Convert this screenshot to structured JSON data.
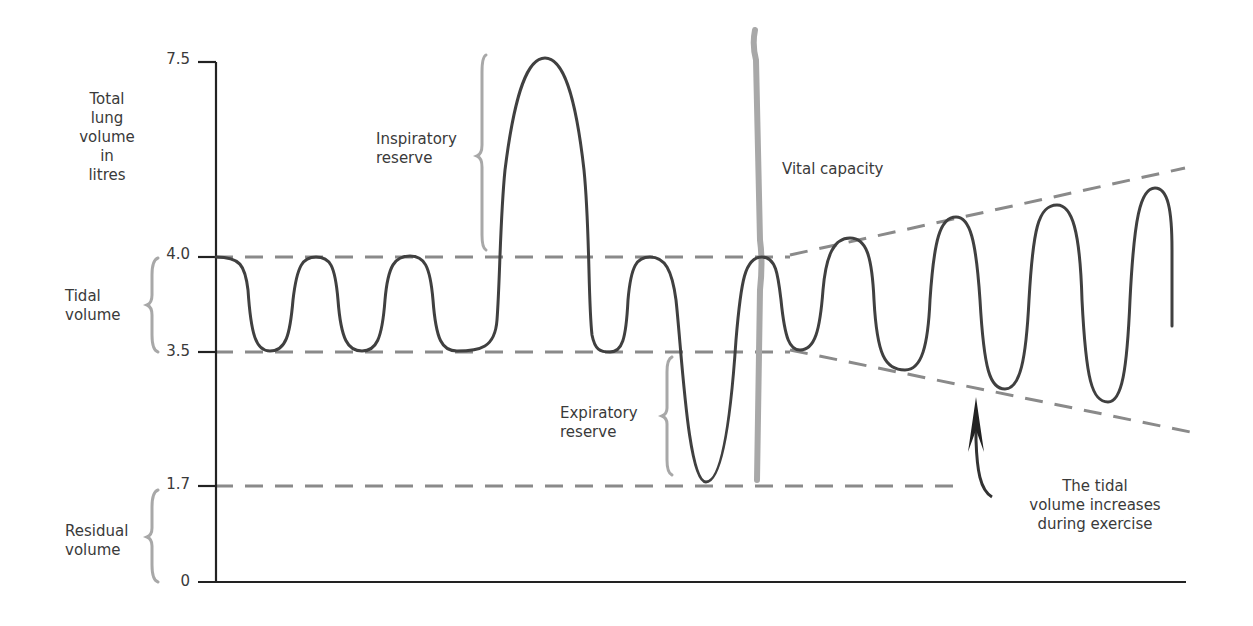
{
  "axis": {
    "y_label": [
      "Total",
      "lung",
      "volume",
      "in",
      "litres"
    ],
    "ticks": [
      {
        "value": "7.5",
        "y": 62
      },
      {
        "value": "4.0",
        "y": 257
      },
      {
        "value": "3.5",
        "y": 352
      },
      {
        "value": "1.7",
        "y": 486
      },
      {
        "value": "0",
        "y": 582
      }
    ]
  },
  "labels": {
    "tidal_volume": [
      "Tidal",
      "volume"
    ],
    "residual_volume": [
      "Residual",
      "volume"
    ],
    "inspiratory_reserve": [
      "Inspiratory",
      "reserve"
    ],
    "expiratory_reserve": [
      "Expiratory",
      "reserve"
    ],
    "vital_capacity": "Vital capacity",
    "exercise_note": [
      "The tidal",
      "volume increases",
      "during exercise"
    ]
  },
  "colors": {
    "trace": "#404040",
    "dashed": "#8a8a8a",
    "brace": "#a8a8a8",
    "axis": "#222222"
  },
  "volumes_litres": {
    "total_lung_capacity": 7.5,
    "tidal_top": 4.0,
    "tidal_bottom": 3.5,
    "residual": 1.7,
    "zero": 0
  }
}
